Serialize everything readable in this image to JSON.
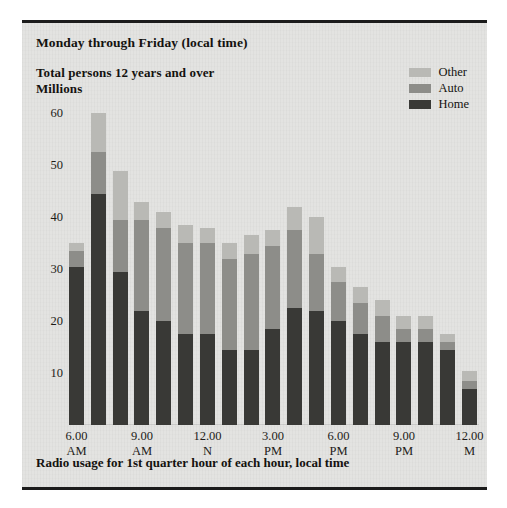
{
  "document": {
    "header_daypart": "Monday through Friday (local time)",
    "subtitle_line_1": "Total persons 12 years and over",
    "subtitle_line_2": "Millions",
    "footnote": "Radio usage for 1st quarter hour of each hour, local time"
  },
  "legend": {
    "position": "top-right",
    "entries": [
      {
        "label": "Other",
        "color": "#b9b9b5"
      },
      {
        "label": "Auto",
        "color": "#8d8d89"
      },
      {
        "label": "Home",
        "color": "#393936"
      }
    ]
  },
  "axes": {
    "y_ticks": [
      "60",
      "50",
      "40",
      "30",
      "20",
      "10"
    ],
    "x_ticks": [
      {
        "line1": "6.00",
        "line2": "AM"
      },
      {
        "line1": "9.00",
        "line2": "AM"
      },
      {
        "line1": "12.00",
        "line2": "N"
      },
      {
        "line1": "3.00",
        "line2": "PM"
      },
      {
        "line1": "6.00",
        "line2": "PM"
      },
      {
        "line1": "9.00",
        "line2": "PM"
      },
      {
        "line1": "12.00",
        "line2": "M"
      }
    ]
  },
  "chart_data": {
    "type": "bar",
    "stacked": true,
    "title": "Monday through Friday (local time)",
    "subtitle": "Total persons 12 years and over / Millions",
    "xlabel": "Radio usage for 1st quarter hour of each hour, local time",
    "ylabel": "Millions",
    "ylim": [
      0,
      62
    ],
    "ytick_values": [
      10,
      20,
      30,
      40,
      50,
      60
    ],
    "grid": false,
    "legend_position": "top-right",
    "categories": [
      "6.00 AM",
      "7.00 AM",
      "8.00 AM",
      "9.00 AM",
      "10.00 AM",
      "11.00 AM",
      "12.00 N",
      "1.00 PM",
      "2.00 PM",
      "3.00 PM",
      "4.00 PM",
      "5.00 PM",
      "6.00 PM",
      "7.00 PM",
      "8.00 PM",
      "9.00 PM",
      "10.00 PM",
      "11.00 PM",
      "12.00 M"
    ],
    "labeled_categories": [
      "6.00 AM",
      "9.00 AM",
      "12.00 N",
      "3.00 PM",
      "6.00 PM",
      "9.00 PM",
      "12.00 M"
    ],
    "series": [
      {
        "name": "Home",
        "color": "#393936",
        "values": [
          30.5,
          44.5,
          29.5,
          22.0,
          20.0,
          17.5,
          17.5,
          14.5,
          14.5,
          18.5,
          22.5,
          22.0,
          20.0,
          17.5,
          16.0,
          16.0,
          16.0,
          14.5,
          7.0
        ]
      },
      {
        "name": "Auto",
        "color": "#8d8d89",
        "values": [
          3.0,
          8.0,
          10.0,
          17.5,
          18.0,
          17.5,
          17.5,
          17.5,
          18.5,
          16.0,
          15.0,
          11.0,
          7.5,
          6.0,
          5.0,
          2.5,
          2.5,
          1.5,
          1.5
        ]
      },
      {
        "name": "Other",
        "color": "#b9b9b5",
        "values": [
          1.5,
          7.5,
          9.5,
          3.5,
          3.0,
          3.5,
          3.0,
          3.0,
          3.5,
          3.0,
          4.5,
          7.0,
          3.0,
          3.0,
          3.0,
          2.5,
          2.5,
          1.5,
          2.0
        ]
      }
    ],
    "totals": [
      35.0,
      60.0,
      49.0,
      43.0,
      41.0,
      38.5,
      38.0,
      35.0,
      36.5,
      37.5,
      42.0,
      40.0,
      30.5,
      26.5,
      24.0,
      21.0,
      21.0,
      17.5,
      10.5
    ]
  }
}
